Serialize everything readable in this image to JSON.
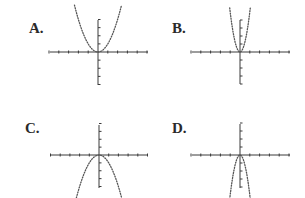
{
  "chart_data": [
    {
      "type": "line",
      "id": "A",
      "title": "A.",
      "description": "Upward-opening parabola, wide, vertex at origin",
      "equation_form": "y = a*x^2, a > 0 (wide)",
      "x_range": [
        -5,
        5
      ],
      "y_range": [
        -4,
        4
      ],
      "x_ticks": [
        -5,
        -4,
        -3,
        -2,
        -1,
        0,
        1,
        2,
        3,
        4,
        5
      ],
      "y_ticks": [
        -4,
        -3,
        -2,
        -1,
        0,
        1,
        2,
        3,
        4
      ],
      "series": [
        {
          "name": "curve",
          "style": "dotted",
          "a": 1,
          "x": [
            -2.4,
            -2,
            -1.5,
            -1,
            -0.5,
            0,
            0.5,
            1,
            1.5,
            2,
            2.4
          ],
          "y": [
            5.8,
            4,
            2.25,
            1,
            0.25,
            0,
            0.25,
            1,
            2.25,
            4,
            5.8
          ]
        }
      ]
    },
    {
      "type": "line",
      "id": "B",
      "title": "B.",
      "description": "Upward-opening parabola, narrow, vertex at origin",
      "equation_form": "y = a*x^2, a > 0 (narrow)",
      "x_range": [
        -5,
        5
      ],
      "y_range": [
        -4,
        4
      ],
      "x_ticks": [
        -5,
        -4,
        -3,
        -2,
        -1,
        0,
        1,
        2,
        3,
        4,
        5
      ],
      "y_ticks": [
        -4,
        -3,
        -2,
        -1,
        0,
        1,
        2,
        3,
        4
      ],
      "series": [
        {
          "name": "curve",
          "style": "dotted",
          "a": 5,
          "x": [
            -1.05,
            -0.8,
            -0.5,
            0,
            0.5,
            0.8,
            1.05
          ],
          "y": [
            5.5,
            3.2,
            1.25,
            0,
            1.25,
            3.2,
            5.5
          ]
        }
      ]
    },
    {
      "type": "line",
      "id": "C",
      "title": "C.",
      "description": "Downward-opening parabola, wide, vertex at origin",
      "equation_form": "y = a*x^2, a < 0 (wide)",
      "x_range": [
        -5,
        5
      ],
      "y_range": [
        -4,
        4
      ],
      "x_ticks": [
        -5,
        -4,
        -3,
        -2,
        -1,
        0,
        1,
        2,
        3,
        4,
        5
      ],
      "y_ticks": [
        -4,
        -3,
        -2,
        -1,
        0,
        1,
        2,
        3,
        4
      ],
      "series": [
        {
          "name": "curve",
          "style": "dotted",
          "a": -1,
          "x": [
            -2.4,
            -2,
            -1.5,
            -1,
            -0.5,
            0,
            0.5,
            1,
            1.5,
            2,
            2.4
          ],
          "y": [
            -5.8,
            -4,
            -2.25,
            -1,
            -0.25,
            0,
            -0.25,
            -1,
            -2.25,
            -4,
            -5.8
          ]
        }
      ]
    },
    {
      "type": "line",
      "id": "D",
      "title": "D.",
      "description": "Downward-opening parabola, narrow, vertex at origin",
      "equation_form": "y = a*x^2, a < 0 (narrow)",
      "x_range": [
        -5,
        5
      ],
      "y_range": [
        -4,
        4
      ],
      "x_ticks": [
        -5,
        -4,
        -3,
        -2,
        -1,
        0,
        1,
        2,
        3,
        4,
        5
      ],
      "y_ticks": [
        -4,
        -3,
        -2,
        -1,
        0,
        1,
        2,
        3,
        4
      ],
      "series": [
        {
          "name": "curve",
          "style": "dotted",
          "a": -5,
          "x": [
            -1.05,
            -0.8,
            -0.5,
            0,
            0.5,
            0.8,
            1.05
          ],
          "y": [
            -5.5,
            -3.2,
            -1.25,
            0,
            -1.25,
            -3.2,
            -5.5
          ]
        }
      ]
    }
  ],
  "labels": {
    "a": "A.",
    "b": "B.",
    "c": "C.",
    "d": "D."
  },
  "colors": {
    "axis": "#3a3a3a",
    "curve": "#555555",
    "label": "#2a2a2a"
  }
}
